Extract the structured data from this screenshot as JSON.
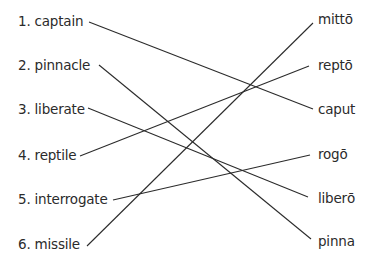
{
  "diagram": {
    "type": "matching-exercise",
    "left_items": [
      {
        "label": "1. captain",
        "x": 18,
        "y": 13
      },
      {
        "label": "2. pinnacle",
        "x": 18,
        "y": 57
      },
      {
        "label": "3. liberate",
        "x": 18,
        "y": 101
      },
      {
        "label": "4. reptile",
        "x": 18,
        "y": 147
      },
      {
        "label": "5. interrogate",
        "x": 18,
        "y": 191
      },
      {
        "label": "6. missile",
        "x": 18,
        "y": 236
      }
    ],
    "right_items": [
      {
        "label": "mittō",
        "x": 318,
        "y": 11
      },
      {
        "label": "reptō",
        "x": 318,
        "y": 57
      },
      {
        "label": "caput",
        "x": 318,
        "y": 101
      },
      {
        "label": "rogō",
        "x": 318,
        "y": 146
      },
      {
        "label": "liberō",
        "x": 318,
        "y": 190
      },
      {
        "label": "pinna",
        "x": 318,
        "y": 233
      }
    ],
    "connections": [
      {
        "from": "1. captain",
        "to": "caput",
        "x1": 89,
        "y1": 22,
        "x2": 313,
        "y2": 109
      },
      {
        "from": "2. pinnacle",
        "to": "pinna",
        "x1": 99,
        "y1": 65,
        "x2": 311,
        "y2": 239
      },
      {
        "from": "3. liberate",
        "to": "liberō",
        "x1": 88,
        "y1": 108,
        "x2": 308,
        "y2": 197
      },
      {
        "from": "4. reptile",
        "to": "reptō",
        "x1": 80,
        "y1": 156,
        "x2": 309,
        "y2": 66
      },
      {
        "from": "5. interrogate",
        "to": "rogō",
        "x1": 113,
        "y1": 200,
        "x2": 310,
        "y2": 155
      },
      {
        "from": "6. missile",
        "to": "mittō",
        "x1": 87,
        "y1": 246,
        "x2": 313,
        "y2": 23
      }
    ]
  }
}
